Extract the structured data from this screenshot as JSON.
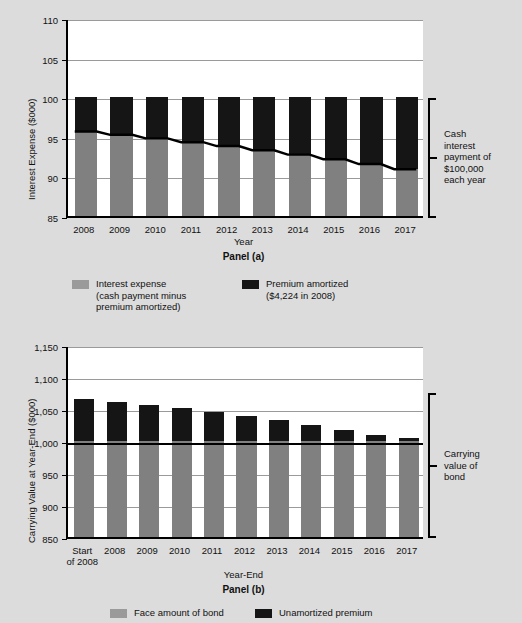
{
  "figure": {
    "background_color": "#dcdcdc",
    "plot_background": "#ffffff",
    "gray_color": "#808080",
    "black_color": "#151515"
  },
  "panel_a": {
    "panel_label": "Panel (a)",
    "xlabel": "Year",
    "ylabel": "Interest Expense ($000)",
    "callout": [
      "Cash",
      "interest",
      "payment of",
      "$100,000",
      "each year"
    ],
    "legend": [
      {
        "swatch": "gray-swatch",
        "lines": [
          "Interest expense",
          "(cash payment minus",
          "premium amortized)"
        ]
      },
      {
        "swatch": "black-swatch",
        "lines": [
          "Premium amortized",
          "($4,224 in 2008)"
        ]
      }
    ]
  },
  "panel_b": {
    "panel_label": "Panel (b)",
    "xlabel": "Year-End",
    "ylabel": "Carrying Value at Year-End ($000)",
    "callout": [
      "Carrying",
      "value of",
      "bond"
    ],
    "legend": [
      {
        "swatch": "gray-swatch",
        "lines": [
          "Face amount of bond"
        ]
      },
      {
        "swatch": "black-swatch",
        "lines": [
          "Unamortized premium"
        ]
      }
    ]
  },
  "chart_data": [
    {
      "type": "bar",
      "id": "panel-a",
      "title": "Panel (a)",
      "xlabel": "Year",
      "ylabel": "Interest Expense ($000)",
      "ylim": [
        85,
        110
      ],
      "yticks": [
        85,
        90,
        95,
        100,
        105,
        110
      ],
      "ytick_labels": [
        "85",
        "90",
        "95",
        "100",
        "105",
        "110"
      ],
      "grid": true,
      "stacked": true,
      "legend_position": "below",
      "categories": [
        "2008",
        "2009",
        "2010",
        "2011",
        "2012",
        "2013",
        "2014",
        "2015",
        "2016",
        "2017"
      ],
      "series": [
        {
          "name": "Interest expense (cash payment minus premium amortized)",
          "color": "#808080",
          "values": [
            95.78,
            95.35,
            94.9,
            94.42,
            93.92,
            93.39,
            92.83,
            92.24,
            91.62,
            90.96
          ]
        },
        {
          "name": "Premium amortized ($4,224 in 2008)",
          "color": "#151515",
          "values": [
            4.22,
            4.65,
            5.1,
            5.58,
            6.08,
            6.61,
            7.17,
            7.76,
            8.38,
            9.04
          ]
        }
      ],
      "totals": [
        100,
        100,
        100,
        100,
        100,
        100,
        100,
        100,
        100,
        100
      ],
      "annotations": [
        {
          "text": "Cash interest payment of $100,000 each year",
          "type": "bracket",
          "position": "right",
          "range": [
            85,
            100
          ]
        },
        {
          "text": "trend line at top of interest expense segment",
          "type": "line"
        }
      ]
    },
    {
      "type": "bar",
      "id": "panel-b",
      "title": "Panel (b)",
      "xlabel": "Year-End",
      "ylabel": "Carrying Value at Year-End ($000)",
      "ylim": [
        850,
        1150
      ],
      "yticks": [
        850,
        900,
        950,
        1000,
        1050,
        1100,
        1150
      ],
      "ytick_labels": [
        "850",
        "900",
        "950",
        "1,000",
        "1,050",
        "1,100",
        "1,150"
      ],
      "grid": true,
      "stacked": true,
      "legend_position": "below",
      "categories": [
        "Start of 2008",
        "2008",
        "2009",
        "2010",
        "2011",
        "2012",
        "2013",
        "2014",
        "2015",
        "2016",
        "2017"
      ],
      "series": [
        {
          "name": "Face amount of bond",
          "color": "#808080",
          "values": [
            1000,
            1000,
            1000,
            1000,
            1000,
            1000,
            1000,
            1000,
            1000,
            1000,
            1000
          ]
        },
        {
          "name": "Unamortized premium",
          "color": "#151515",
          "values": [
            65.0,
            60.8,
            56.1,
            51.0,
            45.4,
            39.4,
            32.7,
            25.6,
            17.8,
            9.4,
            5.0
          ]
        }
      ],
      "totals": [
        1065.0,
        1060.8,
        1056.1,
        1051.0,
        1045.4,
        1039.4,
        1032.7,
        1025.6,
        1017.8,
        1009.4,
        1005.0
      ],
      "annotations": [
        {
          "text": "Carrying value of bond",
          "type": "bracket",
          "position": "right",
          "range": [
            850,
            1065
          ]
        }
      ]
    }
  ]
}
